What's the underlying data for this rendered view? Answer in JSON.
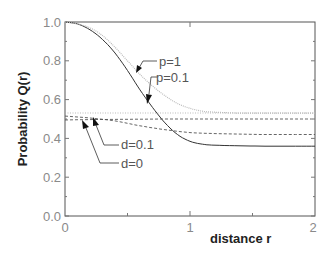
{
  "chart_data": {
    "type": "line",
    "title": "",
    "xlabel": "distance r",
    "ylabel": "Probability Q(r)",
    "xlim": [
      0,
      2
    ],
    "ylim": [
      0,
      1.0
    ],
    "x_ticks": [
      "0",
      "1",
      "2"
    ],
    "y_ticks": [
      "0.0",
      "0.2",
      "0.4",
      "0.6",
      "0.8",
      "1.0"
    ],
    "grid": false,
    "legend": "none (inline annotations)",
    "series": [
      {
        "name": "p=0.1",
        "style": "solid",
        "x": [
          0,
          0.1,
          0.2,
          0.3,
          0.4,
          0.5,
          0.6,
          0.7,
          0.8,
          0.9,
          1.0,
          1.1,
          1.2,
          1.4,
          1.6,
          1.8,
          2.0
        ],
        "y": [
          1.0,
          0.99,
          0.96,
          0.91,
          0.84,
          0.75,
          0.65,
          0.56,
          0.48,
          0.42,
          0.385,
          0.37,
          0.365,
          0.362,
          0.36,
          0.36,
          0.36
        ]
      },
      {
        "name": "p=1",
        "style": "dotted",
        "x": [
          0,
          0.1,
          0.2,
          0.3,
          0.4,
          0.5,
          0.6,
          0.7,
          0.8,
          0.9,
          1.0,
          1.1,
          1.2,
          1.4,
          1.6,
          1.8,
          2.0
        ],
        "y": [
          1.0,
          0.99,
          0.97,
          0.93,
          0.87,
          0.8,
          0.73,
          0.67,
          0.62,
          0.58,
          0.555,
          0.54,
          0.535,
          0.53,
          0.53,
          0.53,
          0.53
        ]
      },
      {
        "name": "d=0.1",
        "style": "dashed",
        "x": [
          0,
          0.2,
          0.4,
          0.6,
          0.8,
          1.0,
          1.2,
          1.4,
          1.6,
          1.8,
          2.0
        ],
        "y": [
          0.515,
          0.505,
          0.49,
          0.465,
          0.445,
          0.43,
          0.425,
          0.422,
          0.42,
          0.42,
          0.42
        ]
      },
      {
        "name": "d=0",
        "style": "dashed",
        "x": [
          0,
          0.2,
          0.4,
          0.6,
          0.8,
          1.0,
          1.2,
          1.4,
          1.6,
          1.8,
          2.0
        ],
        "y": [
          0.495,
          0.497,
          0.498,
          0.499,
          0.5,
          0.5,
          0.5,
          0.5,
          0.5,
          0.5,
          0.5
        ]
      },
      {
        "name": "reference",
        "style": "dotted-thin",
        "x": [
          0,
          2.0
        ],
        "y": [
          0.53,
          0.53
        ]
      }
    ],
    "annotations": [
      {
        "text": "p=1",
        "arrow_to": [
          0.62,
          0.64
        ]
      },
      {
        "text": "p=0.1",
        "arrow_to": [
          0.74,
          0.53
        ]
      },
      {
        "text": "d=0.1",
        "arrow_to": [
          0.13,
          0.51
        ]
      },
      {
        "text": "d=0",
        "arrow_to": [
          0.06,
          0.495
        ]
      }
    ]
  },
  "labels": {
    "xlabel": "distance r",
    "ylabel": "Probability Q(r)",
    "x0": "0",
    "x1": "1",
    "x2": "2",
    "y0": "0.0",
    "y1": "0.2",
    "y2": "0.4",
    "y3": "0.6",
    "y4": "0.8",
    "y5": "1.0",
    "ann_p1": "p=1",
    "ann_p01": "p=0.1",
    "ann_d01": "d=0.1",
    "ann_d0": "d=0"
  }
}
